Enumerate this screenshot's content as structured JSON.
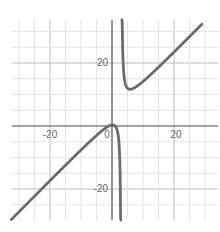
{
  "chart_data": {
    "type": "line",
    "title": "",
    "xlabel": "",
    "ylabel": "",
    "xlim": [
      -32,
      34
    ],
    "ylim": [
      -30,
      34
    ],
    "grid": true,
    "grid_step": 5,
    "x_tick_labels": [
      "-20",
      "0",
      "20"
    ],
    "y_tick_labels": [
      "20",
      "-20"
    ],
    "origin_label": "0",
    "function_description": "rational function with vertical asymptote near x=3 and slant asymptote ~ y = x + 3",
    "vertical_asymptote_x": 3,
    "local_max": [
      0.2,
      0.3
    ],
    "local_min": [
      5.8,
      11.7
    ],
    "series": [
      {
        "name": "curve-left-branch",
        "points": [
          [
            -32,
            -29
          ],
          [
            -20,
            -17.3
          ],
          [
            -10,
            -7.6
          ],
          [
            -4,
            -2.1
          ],
          [
            -1,
            0
          ],
          [
            0.2,
            0.3
          ],
          [
            1,
            0
          ],
          [
            2,
            -3
          ],
          [
            2.6,
            -14.4
          ],
          [
            2.75,
            -29
          ]
        ]
      },
      {
        "name": "curve-right-branch",
        "points": [
          [
            3.25,
            38.3
          ],
          [
            3.5,
            22.5
          ],
          [
            4,
            15
          ],
          [
            5,
            12
          ],
          [
            5.8,
            11.7
          ],
          [
            8,
            12.6
          ],
          [
            12,
            15.9
          ],
          [
            20,
            23.3
          ],
          [
            29,
            32.3
          ]
        ]
      }
    ],
    "line_color": "#6b6b6b",
    "axis_color": "#555555",
    "grid_color": "#e4e4e4"
  },
  "labels": {
    "x_neg20": "-20",
    "x_pos20": "20",
    "origin": "0",
    "y_pos20": "20",
    "y_neg20": "-20"
  }
}
